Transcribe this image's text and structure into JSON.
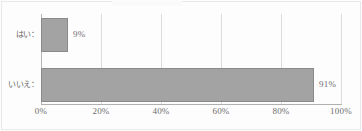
{
  "chart_data": {
    "type": "bar",
    "orientation": "horizontal",
    "title": "",
    "xlabel": "",
    "ylabel": "",
    "categories": [
      "はい：",
      "いいえ："
    ],
    "values": [
      9,
      91
    ],
    "data_labels": [
      "9%",
      "91%"
    ],
    "xlim": [
      0,
      100
    ],
    "xticks": [
      0,
      20,
      40,
      60,
      80,
      100
    ],
    "xtick_labels": [
      "0%",
      "20%",
      "40%",
      "60%",
      "80%",
      "100%"
    ],
    "grid": true,
    "legend": false,
    "series": [
      {
        "name": "",
        "values": [
          9,
          91
        ],
        "bar_color": "#a3a3a3",
        "bar_border_color": "#8a8a8a"
      }
    ]
  },
  "colors": {
    "background": "#fdfdfd",
    "bar_fill": "#a3a3a3",
    "bar_border": "#8a8a8a",
    "gridline": "#dcdcdc",
    "axis": "#b0b0b0",
    "text": "#6e6e6e",
    "frame": "#e9e9e9"
  }
}
